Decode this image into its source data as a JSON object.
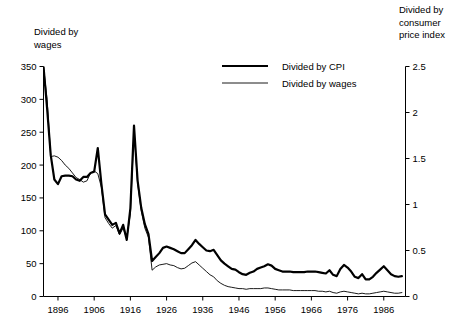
{
  "chart_data": {
    "type": "line",
    "title": "",
    "xlabel": "",
    "ylabel": "Divided by wages",
    "y2label": "Divided by consumer price index",
    "grid": false,
    "legend_position": "top-center",
    "xlim": [
      1892,
      1992
    ],
    "ylim": [
      0,
      350
    ],
    "y2lim": [
      0,
      2.5
    ],
    "xticks": [
      1896,
      1906,
      1916,
      1926,
      1936,
      1946,
      1956,
      1966,
      1976,
      1986
    ],
    "yticks": [
      0,
      50,
      100,
      150,
      200,
      250,
      300,
      350
    ],
    "y2ticks": [
      0,
      0.5,
      1,
      1.5,
      2,
      2.5
    ],
    "x": [
      1892,
      1893,
      1894,
      1895,
      1896,
      1897,
      1898,
      1899,
      1900,
      1901,
      1902,
      1903,
      1904,
      1905,
      1906,
      1907,
      1908,
      1909,
      1910,
      1911,
      1912,
      1913,
      1914,
      1915,
      1916,
      1917,
      1918,
      1919,
      1920,
      1921,
      1922,
      1923,
      1924,
      1925,
      1926,
      1927,
      1928,
      1929,
      1930,
      1931,
      1932,
      1933,
      1934,
      1935,
      1936,
      1937,
      1938,
      1939,
      1940,
      1941,
      1942,
      1943,
      1944,
      1945,
      1946,
      1947,
      1948,
      1949,
      1950,
      1951,
      1952,
      1953,
      1954,
      1955,
      1956,
      1957,
      1958,
      1959,
      1960,
      1961,
      1962,
      1963,
      1964,
      1965,
      1966,
      1967,
      1968,
      1969,
      1970,
      1971,
      1972,
      1973,
      1974,
      1975,
      1976,
      1977,
      1978,
      1979,
      1980,
      1981,
      1982,
      1983,
      1984,
      1985,
      1986,
      1987,
      1988,
      1989,
      1990,
      1991
    ],
    "series": [
      {
        "name": "Divided by CPI",
        "axis": "right",
        "line_width": 2.2,
        "color": "#000000",
        "values_left_scale": [
          350,
          286,
          215,
          178,
          171,
          183,
          184,
          184,
          183,
          178,
          176,
          182,
          182,
          188,
          190,
          226,
          171,
          125,
          117,
          109,
          112,
          96,
          109,
          86,
          134,
          260,
          176,
          135,
          110,
          95,
          54,
          60,
          66,
          74,
          76,
          74,
          72,
          69,
          66,
          66,
          72,
          78,
          86,
          80,
          75,
          70,
          69,
          71,
          63,
          55,
          50,
          46,
          42,
          41,
          37,
          34,
          33,
          36,
          38,
          42,
          44,
          46,
          49,
          47,
          42,
          40,
          38,
          38,
          38,
          37,
          37,
          37,
          37,
          38,
          38,
          38,
          37,
          36,
          35,
          40,
          33,
          31,
          42,
          48,
          44,
          38,
          30,
          28,
          34,
          26,
          26,
          30,
          36,
          41,
          46,
          40,
          34,
          31,
          30,
          31
        ]
      },
      {
        "name": "Divided by wages",
        "axis": "left",
        "line_width": 0.9,
        "color": "#000000",
        "values_left_scale": [
          350,
          300,
          213,
          214,
          212,
          207,
          200,
          195,
          188,
          181,
          178,
          174,
          176,
          188,
          191,
          187,
          166,
          120,
          111,
          104,
          108,
          94,
          104,
          88,
          126,
          252,
          172,
          130,
          104,
          90,
          40,
          45,
          48,
          49,
          50,
          48,
          47,
          44,
          42,
          43,
          47,
          51,
          53,
          48,
          43,
          38,
          33,
          30,
          24,
          20,
          17,
          15,
          14,
          13,
          12,
          12,
          11,
          12,
          12,
          12,
          12,
          13,
          13,
          12,
          11,
          10,
          10,
          10,
          10,
          9,
          9,
          9,
          9,
          9,
          9,
          9,
          8,
          8,
          7,
          8,
          6,
          5,
          7,
          8,
          7,
          6,
          5,
          4,
          5,
          4,
          4,
          5,
          6,
          7,
          8,
          7,
          6,
          5,
          5,
          6
        ]
      }
    ]
  },
  "labels": {
    "left_axis_title": "Divided by\nwages",
    "right_axis_title": "Divided by\nconsumer\nprice index"
  },
  "legend": {
    "items": [
      {
        "label": "Divided by CPI",
        "style": "thick"
      },
      {
        "label": "Divided by wages",
        "style": "thin"
      }
    ]
  }
}
